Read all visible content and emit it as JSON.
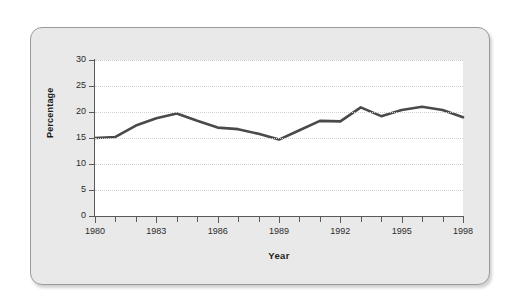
{
  "chart_data": {
    "type": "line",
    "title": "",
    "subtitle": "",
    "xlabel": "Year",
    "ylabel": "Percentage",
    "grid": true,
    "legend": false,
    "legend_position": "none",
    "line_color": "#4a4a4a",
    "plot_background": "#ffffff",
    "panel_background": "#e9e9e9",
    "xlim": [
      1980,
      1998
    ],
    "ylim": [
      0,
      30
    ],
    "yticks": [
      0,
      5,
      10,
      15,
      20,
      25,
      30
    ],
    "ytick_labels": [
      "0",
      "5",
      "10",
      "15",
      "20",
      "25",
      "30"
    ],
    "xticks": [
      1980,
      1981,
      1982,
      1983,
      1984,
      1985,
      1986,
      1987,
      1988,
      1989,
      1990,
      1991,
      1992,
      1993,
      1994,
      1995,
      1996,
      1997,
      1998
    ],
    "xtick_labels_shown": [
      "1980",
      "1983",
      "1986",
      "1989",
      "1992",
      "1995",
      "1998"
    ],
    "x": [
      1980,
      1981,
      1982,
      1983,
      1984,
      1985,
      1986,
      1987,
      1988,
      1989,
      1990,
      1991,
      1992,
      1993,
      1994,
      1995,
      1996,
      1997,
      1998
    ],
    "values": [
      15.0,
      15.2,
      17.4,
      18.8,
      19.7,
      18.3,
      17.0,
      16.7,
      15.8,
      14.7,
      16.5,
      18.3,
      18.2,
      20.9,
      19.2,
      20.4,
      21.0,
      20.4,
      19.0
    ],
    "annotations": []
  },
  "axis": {
    "ylabel": "Percentage",
    "xlabel": "Year"
  }
}
